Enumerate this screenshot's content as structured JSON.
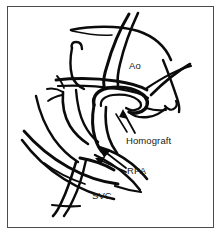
{
  "figure": {
    "background_color": "#ffffff",
    "ink_color": "#0b0b0b",
    "frame_color": "#4a4a4f",
    "label_color": "#1a1a1a"
  },
  "labels": [
    {
      "id": "ao",
      "text": "Ao",
      "structure": "aorta",
      "has_leader_arrow": false
    },
    {
      "id": "homograft",
      "text": "Homograft",
      "structure": "homograft conduit",
      "has_leader_arrow": true
    },
    {
      "id": "rpa",
      "text": "RPA",
      "structure": "right pulmonary artery",
      "has_leader_arrow": true
    },
    {
      "id": "svc",
      "text": "SVC",
      "structure": "superior vena cava",
      "has_leader_arrow": false
    }
  ],
  "structures": [
    {
      "id": "aorta",
      "label": "Ao"
    },
    {
      "id": "aortic-arch",
      "label": ""
    },
    {
      "id": "homograft-conduit",
      "label": "Homograft"
    },
    {
      "id": "right-pulmonary-artery",
      "label": "RPA"
    },
    {
      "id": "superior-vena-cava",
      "label": "SVC"
    },
    {
      "id": "branch-vessel-left",
      "label": ""
    },
    {
      "id": "vessel-stump-hook",
      "label": ""
    },
    {
      "id": "right-crossing-vessel",
      "label": ""
    }
  ]
}
